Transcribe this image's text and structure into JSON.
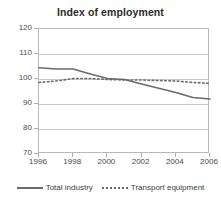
{
  "chart_data": {
    "type": "line",
    "title": "Index of employment",
    "xlabel": "",
    "ylabel": "",
    "xlim": [
      1996,
      2006
    ],
    "ylim": [
      70,
      120
    ],
    "ytick_labels": [
      "120",
      "110",
      "100",
      "90",
      "80",
      "70"
    ],
    "yticks": [
      120,
      110,
      100,
      90,
      80,
      70
    ],
    "xtick_labels": [
      "1996",
      "1998",
      "2000",
      "2002",
      "2004",
      "2006"
    ],
    "xticks": [
      1996,
      1998,
      2000,
      2002,
      2004,
      2006
    ],
    "grid": true,
    "legend_position": "bottom",
    "x": [
      1996,
      1997,
      1998,
      1999,
      2000,
      2001,
      2002,
      2003,
      2004,
      2005,
      2006
    ],
    "series": [
      {
        "name": "Total industry",
        "style": "solid",
        "color": "#6b6b6b",
        "values": [
          104.5,
          104.0,
          104.0,
          102.0,
          100.2,
          99.8,
          98.0,
          96.3,
          94.6,
          92.6,
          92.0
        ]
      },
      {
        "name": "Transport equipment",
        "style": "dotted",
        "color": "#6b6b6b",
        "values": [
          98.6,
          99.2,
          100.2,
          100.2,
          99.8,
          99.6,
          99.6,
          99.4,
          99.2,
          98.6,
          98.2
        ]
      }
    ]
  },
  "legend": {
    "items": [
      {
        "label": "Total industry",
        "swatch": "solid-line-swatch"
      },
      {
        "label": "Transport equipment",
        "swatch": "dotted-line-swatch"
      }
    ]
  }
}
